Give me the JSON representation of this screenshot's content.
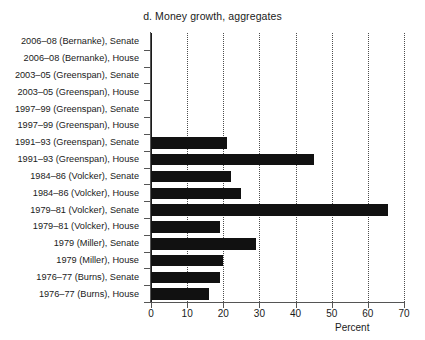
{
  "chart_data": {
    "type": "bar",
    "orientation": "horizontal",
    "title": "d. Money growth, aggregates",
    "xlabel": "Percent",
    "ylabel": "",
    "xlim": [
      0,
      70
    ],
    "xticks": [
      0,
      10,
      20,
      30,
      40,
      50,
      60,
      70
    ],
    "grid": "vertical-dotted",
    "legend": "none",
    "bar_color": "#111111",
    "categories": [
      "2006–08 (Bernanke), Senate",
      "2006–08 (Bernanke), House",
      "2003–05 (Greenspan), Senate",
      "2003–05 (Greenspan), House",
      "1997–99 (Greenspan), Senate",
      "1997–99 (Greenspan), House",
      "1991–93 (Greenspan), Senate",
      "1991–93 (Greenspan), House",
      "1984–86 (Volcker), Senate",
      "1984–86 (Volcker), House",
      "1979–81 (Volcker), Senate",
      "1979–81 (Volcker), House",
      "1979 (Miller), Senate",
      "1979 (Miller), House",
      "1976–77 (Burns), Senate",
      "1976–77 (Burns), House"
    ],
    "values": [
      0,
      0,
      0,
      0,
      0,
      0,
      21,
      45,
      22,
      25,
      65.5,
      19,
      29,
      20,
      19,
      16
    ]
  }
}
